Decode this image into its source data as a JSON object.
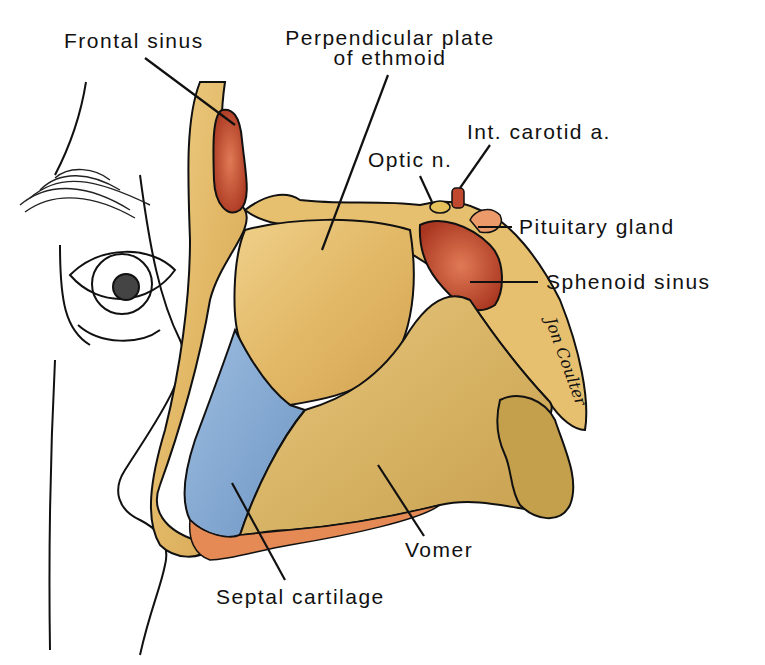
{
  "figure": {
    "signature": "Jon Coulter"
  },
  "labels": {
    "frontal_sinus": "Frontal sinus",
    "perpendicular_plate_line1": "Perpendicular plate",
    "perpendicular_plate_line2": "of ethmoid",
    "int_carotid": "Int. carotid a.",
    "optic_n": "Optic n.",
    "pituitary_gland": "Pituitary gland",
    "sphenoid_sinus": "Sphenoid sinus",
    "vomer": "Vomer",
    "septal_cartilage": "Septal cartilage"
  },
  "colors": {
    "bone_yellow": "#e8c271",
    "bone_dark": "#c99a45",
    "sinus_red": "#b8432a",
    "cartilage_blue": "#7fa6cf",
    "mucosa_orange": "#e58a55",
    "outline": "#111111",
    "vomer_olive": "#c9a64f"
  }
}
